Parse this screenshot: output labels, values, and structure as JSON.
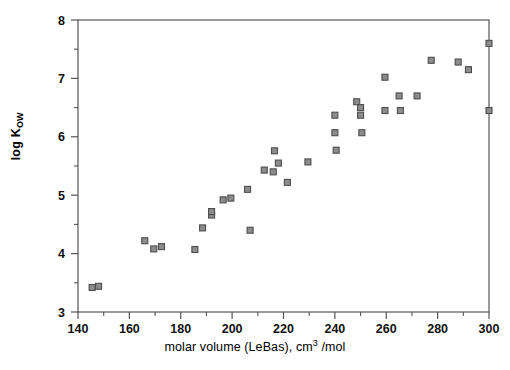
{
  "chart_data": {
    "type": "scatter",
    "title": "",
    "xlabel": "molar volume (LeBas), cm3 /mol",
    "xlabel_parts": {
      "pre": "molar volume (LeBas), cm",
      "sup": "3",
      "post": " /mol"
    },
    "ylabel": "log Kow",
    "ylabel_parts": {
      "main": "log K",
      "sub": "OW"
    },
    "xlim": [
      140,
      300
    ],
    "ylim": [
      3,
      8
    ],
    "xticks": [
      140,
      160,
      180,
      200,
      220,
      240,
      260,
      280,
      300
    ],
    "xticklabels": [
      "140",
      "160",
      "180",
      "200",
      "220",
      "240",
      "260",
      "280",
      "300"
    ],
    "xminor_ticks": [
      150,
      170,
      190,
      210,
      230,
      250,
      270,
      290
    ],
    "yticks": [
      3,
      4,
      5,
      6,
      7,
      8
    ],
    "yticklabels": [
      "3",
      "4",
      "5",
      "6",
      "7",
      "8"
    ],
    "yminor_ticks": [
      3.5,
      4.5,
      5.5,
      6.5,
      7.5
    ],
    "grid": false,
    "legend": null,
    "marker": "square",
    "marker_color": "#8c8c8c",
    "marker_edge_color": "#4d4d4d",
    "axis_color": "#555555",
    "points": [
      {
        "x": 145.5,
        "y": 3.42
      },
      {
        "x": 148.0,
        "y": 3.44
      },
      {
        "x": 166.0,
        "y": 4.22
      },
      {
        "x": 169.5,
        "y": 4.08
      },
      {
        "x": 172.5,
        "y": 4.12
      },
      {
        "x": 185.5,
        "y": 4.07
      },
      {
        "x": 188.5,
        "y": 4.44
      },
      {
        "x": 192.0,
        "y": 4.66
      },
      {
        "x": 192.0,
        "y": 4.72
      },
      {
        "x": 196.5,
        "y": 4.92
      },
      {
        "x": 199.5,
        "y": 4.95
      },
      {
        "x": 206.0,
        "y": 5.1
      },
      {
        "x": 207.0,
        "y": 4.4
      },
      {
        "x": 212.5,
        "y": 5.43
      },
      {
        "x": 216.0,
        "y": 5.4
      },
      {
        "x": 216.5,
        "y": 5.76
      },
      {
        "x": 218.0,
        "y": 5.55
      },
      {
        "x": 221.5,
        "y": 5.22
      },
      {
        "x": 229.5,
        "y": 5.57
      },
      {
        "x": 240.0,
        "y": 6.37
      },
      {
        "x": 240.0,
        "y": 6.07
      },
      {
        "x": 240.5,
        "y": 5.77
      },
      {
        "x": 248.5,
        "y": 6.6
      },
      {
        "x": 250.0,
        "y": 6.5
      },
      {
        "x": 250.0,
        "y": 6.37
      },
      {
        "x": 250.5,
        "y": 6.07
      },
      {
        "x": 259.5,
        "y": 7.02
      },
      {
        "x": 259.5,
        "y": 6.45
      },
      {
        "x": 265.0,
        "y": 6.7
      },
      {
        "x": 265.5,
        "y": 6.45
      },
      {
        "x": 272.0,
        "y": 6.7
      },
      {
        "x": 277.5,
        "y": 7.31
      },
      {
        "x": 288.0,
        "y": 7.28
      },
      {
        "x": 292.0,
        "y": 7.15
      },
      {
        "x": 300.0,
        "y": 7.6
      },
      {
        "x": 300.0,
        "y": 6.45
      }
    ]
  }
}
